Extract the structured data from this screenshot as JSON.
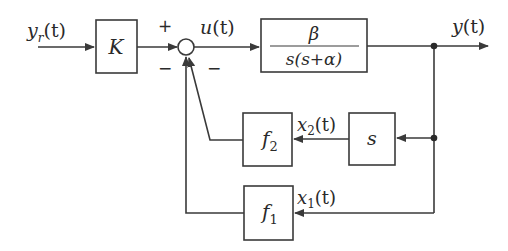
{
  "diagram": {
    "type": "block-diagram",
    "title": "",
    "signals": {
      "reference": "y_r(t)",
      "control": "u(t)",
      "output": "y(t)",
      "state1": "x1(t)",
      "state2": "x2(t)"
    },
    "labels": {
      "input_main": "y",
      "input_sub": "r",
      "input_arg": "(t)",
      "control_main": "u",
      "control_arg": "(t)",
      "output_main": "y",
      "output_arg": "(t)",
      "x2_main": "x",
      "x2_sub": "2",
      "x2_arg": "(t)",
      "x1_main": "x",
      "x1_sub": "1",
      "x1_arg": "(t)"
    },
    "blocks": {
      "gain": {
        "label": "K"
      },
      "plant": {
        "numerator": "β",
        "denominator": "s(s+α)"
      },
      "differentiator": {
        "label": "s"
      },
      "f2": {
        "main": "f",
        "sub": "2"
      },
      "f1": {
        "main": "f",
        "sub": "1"
      }
    },
    "summing_junction": {
      "plus_sign": "+",
      "minus_left": "−",
      "minus_right": "−"
    },
    "colors": {
      "line": "#3a3a3a",
      "background": "#ffffff"
    }
  }
}
